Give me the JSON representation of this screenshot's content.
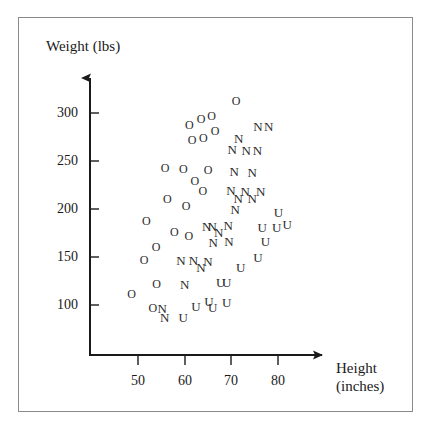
{
  "chart_data": {
    "type": "scatter",
    "title": "",
    "xlabel": "Height (inches)",
    "ylabel": "Weight (lbs)",
    "xlim": [
      44,
      88
    ],
    "ylim": [
      70,
      330
    ],
    "xticks": [
      50,
      60,
      70,
      80
    ],
    "yticks": [
      100,
      150,
      200,
      250,
      300
    ],
    "grid": false,
    "legend": null,
    "marker_note": "Each point is drawn as a letter glyph: O, N, or U",
    "series": [
      {
        "name": "O",
        "marker": "O",
        "points": [
          [
            71.0,
            313
          ],
          [
            65.8,
            297
          ],
          [
            63.5,
            294
          ],
          [
            61.0,
            288
          ],
          [
            66.5,
            281
          ],
          [
            64.0,
            274
          ],
          [
            61.6,
            272
          ],
          [
            55.8,
            243
          ],
          [
            59.7,
            242
          ],
          [
            65.0,
            241
          ],
          [
            62.2,
            229
          ],
          [
            63.9,
            219
          ],
          [
            56.3,
            210
          ],
          [
            60.3,
            203
          ],
          [
            51.8,
            188
          ],
          [
            57.8,
            176
          ],
          [
            60.9,
            172
          ],
          [
            53.9,
            160
          ],
          [
            51.3,
            147
          ],
          [
            54.0,
            122
          ],
          [
            48.6,
            111
          ],
          [
            53.2,
            97
          ]
        ]
      },
      {
        "name": "N",
        "marker": "N",
        "points": [
          [
            75.7,
            286
          ],
          [
            78.0,
            286
          ],
          [
            71.6,
            274
          ],
          [
            70.2,
            263
          ],
          [
            73.2,
            262
          ],
          [
            75.6,
            262
          ],
          [
            70.6,
            240
          ],
          [
            74.5,
            239
          ],
          [
            69.9,
            220
          ],
          [
            73.0,
            219
          ],
          [
            76.3,
            219
          ],
          [
            71.5,
            212
          ],
          [
            74.5,
            211
          ],
          [
            70.8,
            200
          ],
          [
            64.7,
            182
          ],
          [
            65.9,
            182
          ],
          [
            69.3,
            183
          ],
          [
            67.3,
            176
          ],
          [
            66.1,
            166
          ],
          [
            69.5,
            167
          ],
          [
            59.2,
            147
          ],
          [
            61.9,
            147
          ],
          [
            65.0,
            146
          ],
          [
            63.5,
            140
          ],
          [
            60.0,
            122
          ],
          [
            55.2,
            97
          ],
          [
            55.7,
            88
          ]
        ]
      },
      {
        "name": "U",
        "marker": "U",
        "points": [
          [
            80.1,
            197
          ],
          [
            76.6,
            181
          ],
          [
            79.7,
            181
          ],
          [
            82.0,
            184
          ],
          [
            77.3,
            167
          ],
          [
            75.7,
            150
          ],
          [
            72.0,
            140
          ],
          [
            67.7,
            124
          ],
          [
            69.0,
            124
          ],
          [
            65.2,
            104
          ],
          [
            69.0,
            103
          ],
          [
            62.4,
            99
          ],
          [
            66.0,
            98
          ],
          [
            59.7,
            88
          ]
        ]
      }
    ]
  },
  "axis": {
    "y_title": "Weight (lbs)",
    "x_title_line1": "Height",
    "x_title_line2": "(inches)",
    "y_tick_labels": [
      "300",
      "250",
      "200",
      "150",
      "100"
    ],
    "x_tick_labels": [
      "50",
      "60",
      "70",
      "80"
    ]
  }
}
